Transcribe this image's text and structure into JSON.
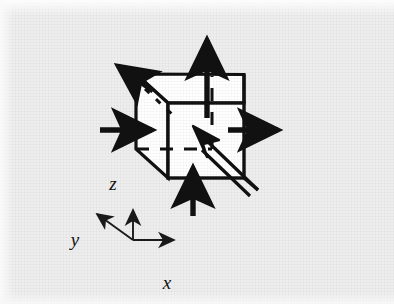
{
  "figure": {
    "domain": "Diagram",
    "background_color": "#eeeeee",
    "ink_color": "#111111",
    "face_color": "#ffffff",
    "width": 394,
    "height": 304
  },
  "axes": {
    "origin": [
      133,
      240
    ],
    "labels": {
      "x": "x",
      "y": "y",
      "z": "z"
    },
    "x_label_pos": [
      172,
      283
    ],
    "y_label_pos": [
      73,
      245
    ],
    "z_label_pos": [
      112,
      186
    ],
    "x_tip": [
      182,
      240
    ],
    "y_tip": [
      90,
      208
    ],
    "z_tip": [
      133,
      202
    ]
  },
  "cube": {
    "front_top_left": [
      168,
      103
    ],
    "front_top_right": [
      244,
      103
    ],
    "front_bottom_left": [
      168,
      178
    ],
    "front_bottom_right": [
      244,
      178
    ],
    "back_top_left": [
      136,
      74
    ],
    "back_top_right": [
      244,
      85
    ],
    "back_bottom_left": [
      136,
      149
    ],
    "hidden_edges": "dashed"
  },
  "arrows": [
    {
      "name": "top-normal-arrow",
      "label": "top face normal force",
      "direction": "up",
      "from": [
        207,
        117
      ],
      "to": [
        207,
        33
      ]
    },
    {
      "name": "bottom-normal-arrow",
      "label": "bottom face normal force",
      "direction": "up",
      "from": [
        193,
        215
      ],
      "to": [
        193,
        163
      ]
    },
    {
      "name": "right-normal-arrow",
      "label": "right face normal force",
      "direction": "right",
      "from": [
        228,
        130
      ],
      "to": [
        288,
        130
      ]
    },
    {
      "name": "left-normal-arrow",
      "label": "left face normal force",
      "direction": "right",
      "from": [
        100,
        130
      ],
      "to": [
        160,
        130
      ]
    },
    {
      "name": "back-left-normal-arrow",
      "label": "back-left face normal force",
      "direction": "up-left",
      "from": [
        152,
        90
      ],
      "to": [
        112,
        62
      ]
    },
    {
      "name": "diagonal-shear-arrow",
      "label": "diagonal shear force toward cube center",
      "direction": "up-left",
      "from": [
        256,
        185
      ],
      "to": [
        196,
        128
      ],
      "style": "double-line open shaft"
    }
  ]
}
